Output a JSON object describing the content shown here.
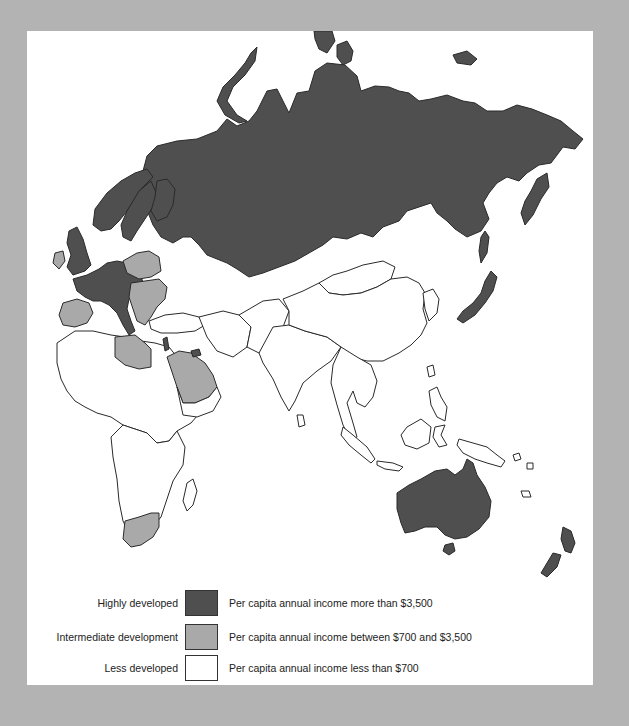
{
  "map": {
    "title_fragment": "",
    "colors": {
      "background": "#b3b3b3",
      "panel": "#ffffff",
      "highly_developed": "#4f4f4f",
      "intermediate_development": "#a9a9a9",
      "less_developed": "#ffffff",
      "border": "#2a2a2a"
    },
    "regions": {
      "highly_developed": [
        "Soviet Union",
        "Scandinavia",
        "Western Europe",
        "United Kingdom",
        "Japan",
        "Australia",
        "New Zealand",
        "Israel",
        "Kuwait"
      ],
      "intermediate_development": [
        "Spain",
        "Portugal",
        "Ireland",
        "Poland",
        "Eastern Europe",
        "Libya",
        "Saudi Arabia",
        "South Africa"
      ],
      "less_developed": [
        "Africa (most)",
        "Middle East (most)",
        "South Asia",
        "China",
        "Southeast Asia",
        "Indonesia"
      ]
    }
  },
  "legend": {
    "items": [
      {
        "label": "Highly developed",
        "description": "Per capita annual income more than $3,500",
        "color": "#4f4f4f"
      },
      {
        "label": "Intermediate development",
        "description": "Per capita annual income between $700 and $3,500",
        "color": "#a9a9a9"
      },
      {
        "label": "Less developed",
        "description": "Per capita annual income less than $700",
        "color": "#ffffff"
      }
    ]
  }
}
